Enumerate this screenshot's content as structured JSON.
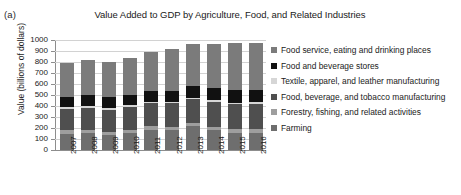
{
  "panel": {
    "label": "(a)"
  },
  "colors": {
    "food_service": "#7b7b7b",
    "food_beverage_stores": "#111111",
    "textile": "#d6d6d6",
    "food_beverage_tobacco_mfg": "#4f4f4f",
    "forestry": "#9e9e9e",
    "farming": "#6e6e6e",
    "grid": "#d2d2d2",
    "axis": "#8d8d8d",
    "text": "#1a1a1a",
    "background": "#ffffff"
  },
  "legend": {
    "position": "right",
    "items": [
      {
        "label": "Food service, eating and drinking places",
        "swatch": "#7b7b7b"
      },
      {
        "label": "Food and beverage stores",
        "swatch": "#111111"
      },
      {
        "label": "Textile, apparel, and leather manufacturing",
        "swatch": "#d6d6d6"
      },
      {
        "label": "Food, beverage, and tobacco manufacturing",
        "swatch": "#4f4f4f"
      },
      {
        "label": "Forestry, fishing, and related activities",
        "swatch": "#9e9e9e"
      },
      {
        "label": "Farming",
        "swatch": "#6e6e6e"
      }
    ]
  },
  "chart_data": {
    "type": "bar",
    "stacked": true,
    "title": "Value Added to GDP by Agriculture, Food, and Related Industries",
    "xlabel": "",
    "ylabel": "Value (billions of dollars)",
    "ylim": [
      0,
      1000
    ],
    "ytick_step": 100,
    "yticks": [
      0,
      100,
      200,
      300,
      400,
      500,
      600,
      700,
      800,
      900,
      1000
    ],
    "ytick_labels": [
      "0",
      "100",
      "200",
      "300",
      "400",
      "500",
      "600",
      "700",
      "800",
      "900",
      "1000"
    ],
    "grid": true,
    "categories": [
      "2007",
      "2008",
      "2009",
      "2010",
      "2011",
      "2012",
      "2013",
      "2014",
      "2015",
      "2016"
    ],
    "series": [
      {
        "name": "Farming",
        "color": "#6e6e6e",
        "values": [
          150,
          155,
          140,
          155,
          185,
          180,
          215,
          180,
          155,
          155
        ]
      },
      {
        "name": "Forestry, fishing, and related activities",
        "color": "#9e9e9e",
        "values": [
          30,
          30,
          28,
          30,
          30,
          30,
          32,
          32,
          32,
          32
        ]
      },
      {
        "name": "Food, beverage, and tobacco manufacturing",
        "color": "#4f4f4f",
        "values": [
          195,
          200,
          200,
          205,
          210,
          215,
          215,
          225,
          230,
          235
        ]
      },
      {
        "name": "Textile, apparel, and leather manufacturing",
        "color": "#d6d6d6",
        "values": [
          18,
          17,
          15,
          15,
          15,
          15,
          15,
          15,
          15,
          15
        ]
      },
      {
        "name": "Food and beverage stores",
        "color": "#111111",
        "values": [
          92,
          98,
          97,
          95,
          95,
          100,
          103,
          108,
          113,
          113
        ]
      },
      {
        "name": "Food service, eating and drinking places",
        "color": "#7b7b7b",
        "values": [
          305,
          320,
          320,
          340,
          360,
          380,
          380,
          405,
          430,
          425
        ]
      }
    ],
    "totals": [
      790,
      820,
      800,
      840,
      895,
      920,
      960,
      965,
      975,
      975
    ]
  }
}
